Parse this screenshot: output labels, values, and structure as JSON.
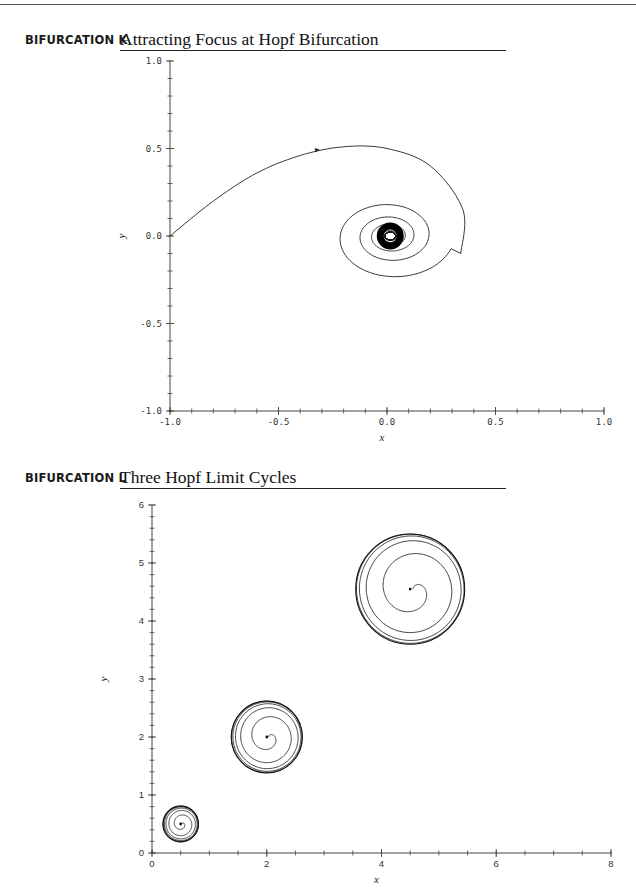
{
  "page": {
    "sections": [
      {
        "label": "BIFURCATION K",
        "title": "Attracting Focus at Hopf Bifurcation"
      },
      {
        "label": "BIFURCATION L",
        "title": "Three Hopf Limit Cycles"
      }
    ]
  },
  "chart_data": [
    {
      "type": "line",
      "title": "Attracting Focus at Hopf Bifurcation",
      "xlabel": "x",
      "ylabel": "y",
      "xlim": [
        -1.0,
        1.0
      ],
      "ylim": [
        -1.0,
        1.0
      ],
      "x_tick_labels": [
        "-1.0",
        "-0.5",
        "0.0",
        "0.5",
        "1.0"
      ],
      "y_tick_labels": [
        "-1.0",
        "-0.5",
        "0.0",
        "0.5",
        "1.0"
      ],
      "x_ticks": [
        -1.0,
        -0.5,
        0.0,
        0.5,
        1.0
      ],
      "y_ticks": [
        -1.0,
        -0.5,
        0.0,
        0.5,
        1.0
      ],
      "minor_tick_step": 0.1,
      "grid": false,
      "series": [
        {
          "name": "trajectory",
          "description": "Trajectory starting at (-1.0, 0.0), rising to a maximum near (-0.15, 0.51), then spiraling clockwise toward a focus at (0.0, 0.0)",
          "start": [
            -1.0,
            0.0
          ],
          "arrow_at": [
            -0.32,
            0.49
          ],
          "points": [
            [
              -1.0,
              0.0
            ],
            [
              -0.8,
              0.2
            ],
            [
              -0.6,
              0.36
            ],
            [
              -0.4,
              0.46
            ],
            [
              -0.2,
              0.51
            ],
            [
              0.0,
              0.5
            ],
            [
              0.2,
              0.4
            ],
            [
              0.35,
              0.15
            ],
            [
              0.34,
              -0.1
            ],
            [
              0.2,
              -0.26
            ],
            [
              0.0,
              -0.3
            ],
            [
              -0.15,
              -0.2
            ],
            [
              -0.18,
              0.0
            ],
            [
              -0.1,
              0.17
            ],
            [
              0.05,
              0.2
            ]
          ],
          "focus": [
            0.0,
            0.0
          ]
        }
      ]
    },
    {
      "type": "line",
      "title": "Three Hopf Limit Cycles",
      "xlabel": "x",
      "ylabel": "y",
      "xlim": [
        0,
        8
      ],
      "ylim": [
        0,
        6
      ],
      "x_tick_labels": [
        "0",
        "2",
        "4",
        "6",
        "8"
      ],
      "y_tick_labels": [
        "0",
        "1",
        "2",
        "3",
        "4",
        "5",
        "6"
      ],
      "x_ticks": [
        0,
        2,
        4,
        6,
        8
      ],
      "y_ticks": [
        0,
        1,
        2,
        3,
        4,
        5,
        6
      ],
      "minor_tick_step_x": 0.5,
      "minor_tick_step_y": 0.2,
      "grid": false,
      "series": [
        {
          "name": "cycle-1",
          "center": [
            0.5,
            0.5
          ],
          "limit_cycle_radius": 0.31,
          "inner_turns": 4
        },
        {
          "name": "cycle-2",
          "center": [
            2.0,
            2.0
          ],
          "limit_cycle_radius": 0.62,
          "inner_turns": 3
        },
        {
          "name": "cycle-3",
          "center": [
            4.5,
            4.55
          ],
          "limit_cycle_radius": 0.95,
          "inner_turns": 2
        }
      ]
    }
  ]
}
